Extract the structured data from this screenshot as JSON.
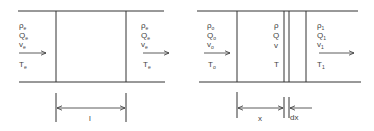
{
  "diagrams": [
    {
      "id": "uniform-segment",
      "inlet": {
        "rho": "ρ",
        "rho_sub": "e",
        "Q": "Q",
        "Q_sub": "e",
        "v": "v",
        "v_sub": "e",
        "T": "T",
        "T_sub": "e"
      },
      "outlet": {
        "rho": "ρ",
        "rho_sub": "e",
        "Q": "Q",
        "Q_sub": "e",
        "v": "v",
        "v_sub": "e",
        "T": "T",
        "T_sub": "e"
      },
      "dimension": {
        "label": "l"
      }
    },
    {
      "id": "differential-segment",
      "inlet": {
        "rho": "ρ",
        "rho_sub": "o",
        "Q": "Q",
        "Q_sub": "o",
        "v": "v",
        "v_sub": "o",
        "T": "T",
        "T_sub": "o"
      },
      "element": {
        "rho": "ρ",
        "Q": "Q",
        "v": "v",
        "T": "T"
      },
      "outlet": {
        "rho": "ρ",
        "rho_sub": "1",
        "Q": "Q",
        "Q_sub": "1",
        "v": "v",
        "v_sub": "1",
        "T": "T",
        "T_sub": "1"
      },
      "dimensions": {
        "x_label": "x",
        "dx_label": "dx"
      }
    }
  ],
  "colors": {
    "line": "#333333",
    "background": "#ffffff"
  }
}
